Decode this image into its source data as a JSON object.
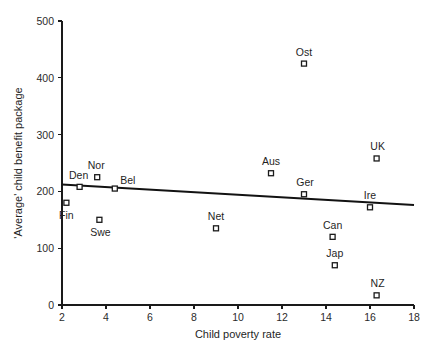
{
  "chart_data": {
    "type": "scatter",
    "title": "",
    "xlabel": "Child poverty rate",
    "ylabel": "'Average' child benefit package",
    "xlim": [
      2,
      18
    ],
    "ylim": [
      0,
      500
    ],
    "xticks": [
      2,
      4,
      6,
      8,
      10,
      12,
      14,
      16,
      18
    ],
    "yticks": [
      0,
      100,
      200,
      300,
      400,
      500
    ],
    "xtick_labels": [
      "2",
      "4",
      "6",
      "8",
      "10",
      "12",
      "14",
      "16",
      "18"
    ],
    "ytick_labels": [
      "0",
      "100",
      "200",
      "300",
      "400",
      "500"
    ],
    "grid": false,
    "legend": null,
    "marker_style": "open-square",
    "points": [
      {
        "label": "Fin",
        "x": 2.2,
        "y": 180,
        "label_dx": 0,
        "label_dy": 16
      },
      {
        "label": "Den",
        "x": 2.8,
        "y": 208,
        "label_dx": -1,
        "label_dy": -8
      },
      {
        "label": "Nor",
        "x": 3.6,
        "y": 225,
        "label_dx": -1,
        "label_dy": -8
      },
      {
        "label": "Swe",
        "x": 3.7,
        "y": 150,
        "label_dx": 1,
        "label_dy": 16
      },
      {
        "label": "Bel",
        "x": 4.4,
        "y": 205,
        "label_dx": 13,
        "label_dy": -5
      },
      {
        "label": "Net",
        "x": 9.0,
        "y": 135,
        "label_dx": 0,
        "label_dy": -8
      },
      {
        "label": "Aus",
        "x": 11.5,
        "y": 232,
        "label_dx": 0,
        "label_dy": -8
      },
      {
        "label": "Ger",
        "x": 13.0,
        "y": 195,
        "label_dx": 1,
        "label_dy": -8
      },
      {
        "label": "Ost",
        "x": 13.0,
        "y": 425,
        "label_dx": 0,
        "label_dy": -8
      },
      {
        "label": "Can",
        "x": 14.3,
        "y": 120,
        "label_dx": 0,
        "label_dy": -8
      },
      {
        "label": "Jap",
        "x": 14.4,
        "y": 70,
        "label_dx": 0,
        "label_dy": -8
      },
      {
        "label": "Ire",
        "x": 16.0,
        "y": 172,
        "label_dx": 0,
        "label_dy": -8
      },
      {
        "label": "UK",
        "x": 16.3,
        "y": 258,
        "label_dx": 1,
        "label_dy": -8
      },
      {
        "label": "NZ",
        "x": 16.3,
        "y": 17,
        "label_dx": 1,
        "label_dy": -8
      }
    ],
    "trendline": {
      "x_start": 2,
      "y_start": 212,
      "x_end": 18,
      "y_end": 176
    }
  },
  "caption": {
    "text": ""
  }
}
